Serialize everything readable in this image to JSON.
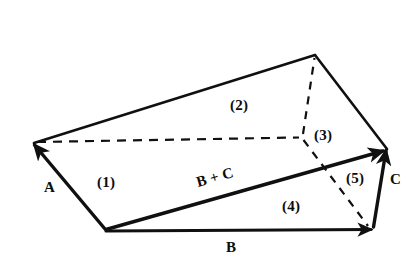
{
  "figure": {
    "background_color": "#ffffff",
    "ink_color": "#101010",
    "vectors": [
      {
        "name": "A",
        "label": "A",
        "x": 44,
        "y": 180,
        "from": [
          105,
          229
        ],
        "to": [
          33,
          143
        ],
        "style": "solid-arrow"
      },
      {
        "name": "B",
        "label": "B",
        "x": 226,
        "y": 240,
        "from": [
          105,
          231
        ],
        "to": [
          372,
          230
        ],
        "style": "solid-arrow"
      },
      {
        "name": "C",
        "label": "C",
        "x": 390,
        "y": 172,
        "from": [
          374,
          227
        ],
        "to": [
          386,
          147
        ],
        "style": "solid-arrow"
      },
      {
        "name": "B plus C",
        "label": "B + C",
        "x": 196,
        "y": 170,
        "rotate": -15.8,
        "from": [
          105,
          229
        ],
        "to": [
          385,
          150
        ],
        "style": "solid-arrow"
      }
    ],
    "face_labels": [
      {
        "name": "face-1",
        "label": "(1)",
        "x": 97,
        "y": 175
      },
      {
        "name": "face-2",
        "label": "(2)",
        "x": 230,
        "y": 98
      },
      {
        "name": "face-3",
        "label": "(3)",
        "x": 314,
        "y": 128
      },
      {
        "name": "face-4",
        "label": "(4)",
        "x": 282,
        "y": 199
      },
      {
        "name": "face-5",
        "label": "(5)",
        "x": 346,
        "y": 171
      }
    ],
    "vertices": {
      "left": [
        33,
        143
      ],
      "bottom_left": [
        105,
        229
      ],
      "top_right": [
        315,
        55
      ],
      "hidden_back": [
        302,
        137
      ],
      "right_tip": [
        386,
        148
      ],
      "bottom_right": [
        372,
        228
      ]
    },
    "solid_edges": [
      {
        "name": "edge-left-to-top",
        "from": [
          33,
          143
        ],
        "to": [
          315,
          55
        ]
      },
      {
        "name": "edge-top-to-right",
        "from": [
          315,
          55
        ],
        "to": [
          386,
          148
        ]
      },
      {
        "name": "edge-bottom-b",
        "from": [
          105,
          231
        ],
        "to": [
          372,
          230
        ]
      },
      {
        "name": "edge-a",
        "from": [
          105,
          229
        ],
        "to": [
          33,
          143
        ]
      },
      {
        "name": "edge-c",
        "from": [
          374,
          227
        ],
        "to": [
          386,
          147
        ]
      },
      {
        "name": "edge-b-plus-c",
        "from": [
          105,
          229
        ],
        "to": [
          385,
          150
        ]
      }
    ],
    "dashed_edges": [
      {
        "name": "dashed-horizontal",
        "from": [
          36,
          142
        ],
        "to": [
          300,
          137
        ]
      },
      {
        "name": "dashed-vertical-back",
        "from": [
          302,
          137
        ],
        "to": [
          315,
          57
        ]
      },
      {
        "name": "dashed-diagonal",
        "from": [
          302,
          137
        ],
        "to": [
          368,
          226
        ]
      }
    ]
  }
}
